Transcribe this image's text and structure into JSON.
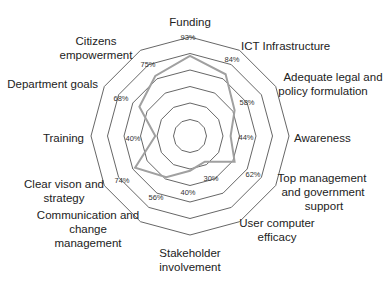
{
  "chart_data": {
    "type": "radar",
    "title": "",
    "categories": [
      "Funding",
      "ICT Infrastructure",
      "Adequate legal and policy formulation",
      "Awareness",
      "Top management and government support",
      "User computer efficacy",
      "Stakeholder involvement",
      "Communication and change management",
      "Clear vison and strategy",
      "Training",
      "Department goals",
      "Citizens empowerment"
    ],
    "annotations": [
      "93%",
      "84%",
      "58%",
      "44%",
      "62%",
      "30%",
      "40%",
      "56%",
      "74%",
      "40%",
      "68%",
      "75%"
    ],
    "series": [
      {
        "name": "Series 1",
        "values": [
          81,
          72,
          52,
          41,
          52,
          30,
          35,
          48,
          64,
          35,
          59,
          70
        ],
        "color": "#a0a0a0"
      }
    ],
    "rlim": [
      0,
      100
    ],
    "rings": 6,
    "grid": true,
    "legend": "none"
  },
  "labels": {
    "funding": "Funding",
    "ict": "ICT Infrastructure",
    "legal_1": "Adequate legal and",
    "legal_2": "policy formulation",
    "awareness": "Awareness",
    "top_1": "Top management",
    "top_2": "and government",
    "top_3": "support",
    "user_1": "User computer",
    "user_2": "efficacy",
    "stake_1": "Stakeholder",
    "stake_2": "involvement",
    "comm_1": "Communication and",
    "comm_2": "change",
    "comm_3": "management",
    "clear_1": "Clear vison and",
    "clear_2": "strategy",
    "training": "Training",
    "dept": "Department goals",
    "cit_1": "Citizens",
    "cit_2": "empowerment"
  },
  "pcts": {
    "funding": "93%",
    "ict": "84%",
    "legal": "58%",
    "awareness": "44%",
    "top": "62%",
    "user": "30%",
    "stake": "40%",
    "comm": "56%",
    "clear": "74%",
    "training": "40%",
    "dept": "68%",
    "cit": "75%"
  }
}
